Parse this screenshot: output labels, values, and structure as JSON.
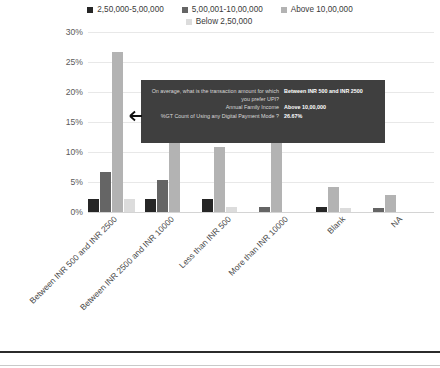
{
  "chart_data": {
    "type": "bar",
    "title": "",
    "subtitle": "",
    "xlabel": "",
    "ylabel": "",
    "ylim": [
      0,
      30
    ],
    "ytick_labels": [
      "30%",
      "25%",
      "20%",
      "15%",
      "10%",
      "5%",
      "0%"
    ],
    "ytick_values": [
      30,
      25,
      20,
      15,
      10,
      5,
      0
    ],
    "grid": true,
    "legend_position": "top",
    "orientation": "vertical",
    "categories": [
      "Between INR 500 and INR 2500",
      "Between INR 2500 and INR 10000",
      "Less than INR 500",
      "More than INR 10000",
      "Blank",
      "NA"
    ],
    "series": [
      {
        "name": "2,50,000-5,00,000",
        "color": "#262626",
        "values": [
          2.1,
          2.1,
          2.1,
          0,
          0.8,
          0
        ]
      },
      {
        "name": "5,00,001-10,00,000",
        "color": "#656565",
        "values": [
          6.6,
          5.4,
          0,
          0.9,
          0,
          0.7
        ]
      },
      {
        "name": "Above 10,00,000",
        "color": "#b3b3b3",
        "values": [
          26.67,
          15.3,
          10.9,
          12.0,
          4.1,
          2.9
        ]
      },
      {
        "name": "Below 2,50,000",
        "color": "#dcdcdc",
        "values": [
          2.2,
          0,
          0.9,
          0,
          0.7,
          0
        ]
      }
    ],
    "annotations": [
      {
        "type": "tooltip",
        "target_series": "Above 10,00,000",
        "target_category": "Between INR 500 and INR 2500",
        "rows": [
          {
            "label": "On average, what is the transaction amount for which you prefer UPI?",
            "value": "Between INR 500 and INR 2500"
          },
          {
            "label": "Annual Family Income",
            "value": "Above 10,00,000"
          },
          {
            "label": "%GT Count of Using any Digital Payment Mode ?",
            "value": "26.67%"
          }
        ]
      }
    ]
  },
  "legend": {
    "items": [
      {
        "label": "2,50,000-5,00,000",
        "color": "#262626"
      },
      {
        "label": "5,00,001-10,00,000",
        "color": "#656565"
      },
      {
        "label": "Above 10,00,000",
        "color": "#b3b3b3"
      },
      {
        "label": "Below 2,50,000",
        "color": "#dcdcdc"
      }
    ]
  },
  "colors": {
    "gridline": "#e8e8e8",
    "axis_text": "#5a5a5a",
    "tooltip_bg": "#3f3f3f",
    "tooltip_text": "#d9d9d9",
    "tooltip_value_text": "#ffffff",
    "rule_dark": "#2b2b2b",
    "rule_light": "#c9c9c9"
  }
}
